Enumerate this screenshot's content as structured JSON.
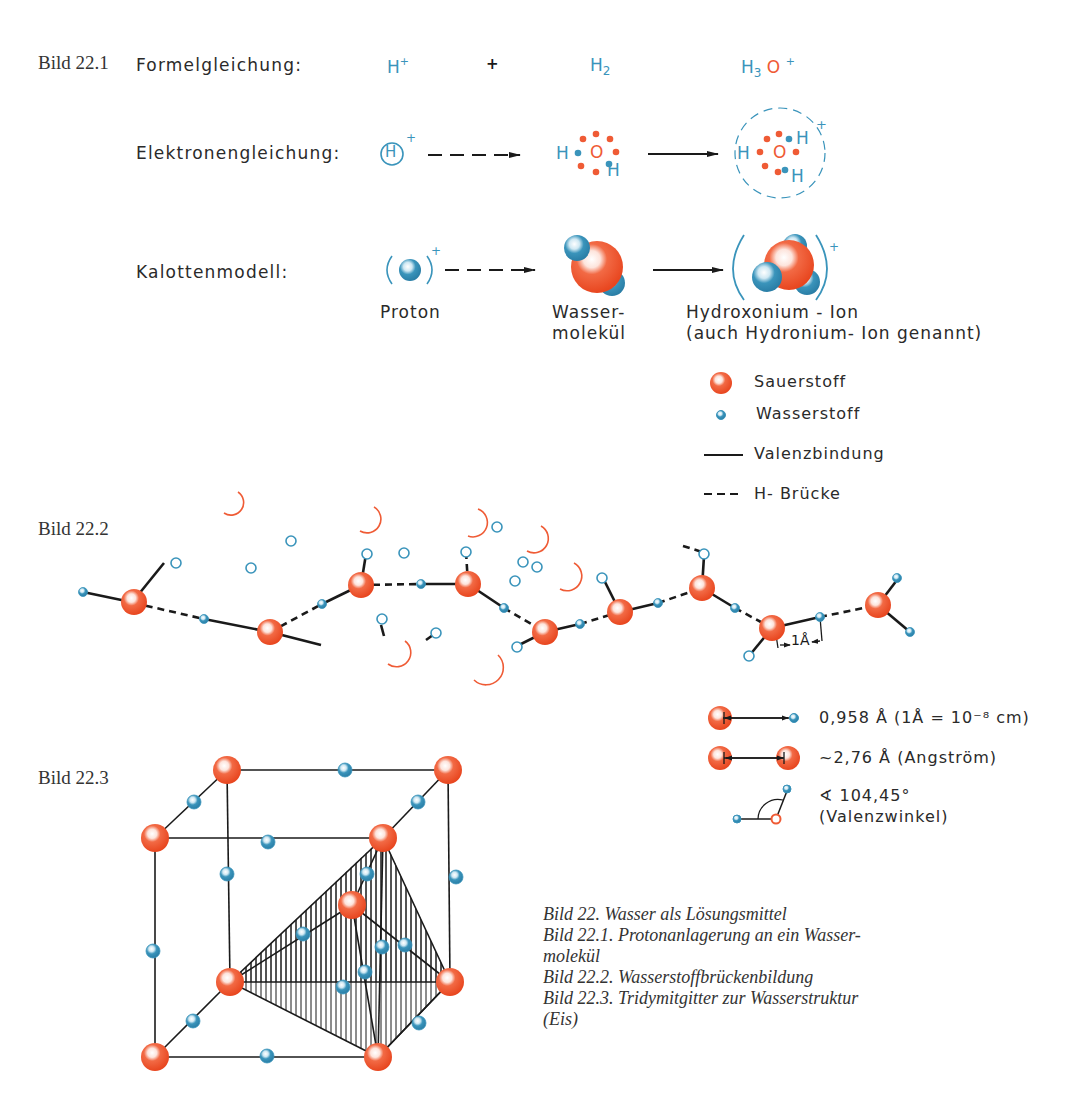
{
  "figure_22_1": {
    "label": "Bild 22.1",
    "rows": {
      "formula": {
        "label": "Formelgleichung:",
        "reactant1": "H",
        "reactant1_charge": "+",
        "plus": "+",
        "reactant2": "H",
        "reactant2_sub": "2",
        "product_h": "H",
        "product_h_sub": "3",
        "product_o": "O",
        "product_charge": "+"
      },
      "electron": {
        "label": "Elektronengleichung:",
        "proton_symbol": "H",
        "proton_charge": "+",
        "water_h_left": "H",
        "water_o": "O",
        "water_h_right": "H",
        "ion_h_left": "H",
        "ion_o": "O",
        "ion_h_top": "H",
        "ion_h_bottom": "H",
        "ion_charge": "+"
      },
      "space_filling": {
        "label": "Kalottenmodell:",
        "proton_charge": "+",
        "ion_charge": "+",
        "proton_caption": "Proton",
        "water_caption_line1": "Wasser-",
        "water_caption_line2": "molekül",
        "ion_caption_line1": "Hydroxonium - Ion",
        "ion_caption_line2": "(auch Hydronium- Ion genannt)"
      }
    }
  },
  "legend": {
    "items": [
      {
        "symbol": "oxygen-sphere",
        "label": "Sauerstoff"
      },
      {
        "symbol": "hydrogen-sphere",
        "label": "Wasserstoff"
      },
      {
        "symbol": "solid-line",
        "label": "Valenzbindung"
      },
      {
        "symbol": "dashed-line",
        "label": "H- Brücke"
      }
    ]
  },
  "figure_22_2": {
    "label": "Bild 22.2",
    "scale_label": "1Å"
  },
  "dimensions": {
    "oh_bond": "0,958 Å (1Å = 10⁻⁸ cm)",
    "oo_distance": "~2,76 Å (Angström)",
    "angle_line1": "∢ 104,45°",
    "angle_line2": "(Valenzwinkel)"
  },
  "figure_22_3": {
    "label": "Bild 22.3"
  },
  "captions": [
    "Bild 22. Wasser als Lösungsmittel",
    "Bild 22.1. Protonanlagerung an ein Wasser-",
    "molekül",
    "Bild 22.2. Wasserstoffbrückenbildung",
    "Bild 22.3. Tridymitgitter zur Wasserstruktur",
    "(Eis)"
  ],
  "colors": {
    "oxygen": "#ef5b35",
    "hydrogen": "#3a94bb",
    "bond": "#1a1a1a",
    "text": "#2a2a2a"
  }
}
